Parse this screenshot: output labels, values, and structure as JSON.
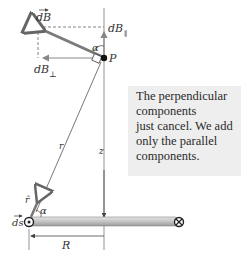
{
  "diagram": {
    "labels": {
      "dB_vector": "dB",
      "dB_parallel": "dB",
      "dB_parallel_sub": "∥",
      "dB_perp": "dB",
      "dB_perp_sub": "⊥",
      "alpha_top": "α",
      "point": "P",
      "r": "r",
      "z": "z",
      "r_hat": "r̂",
      "ds": "ds",
      "alpha_bottom": "α",
      "R": "R"
    },
    "note": {
      "lines": [
        "The perpendicular",
        "components",
        "just cancel. We add",
        "only the parallel",
        "components."
      ]
    },
    "colors": {
      "ring": "#c8c8c8",
      "vector": "#7a7a7a",
      "note_bg": "#eeeeee",
      "line": "#555555"
    }
  }
}
